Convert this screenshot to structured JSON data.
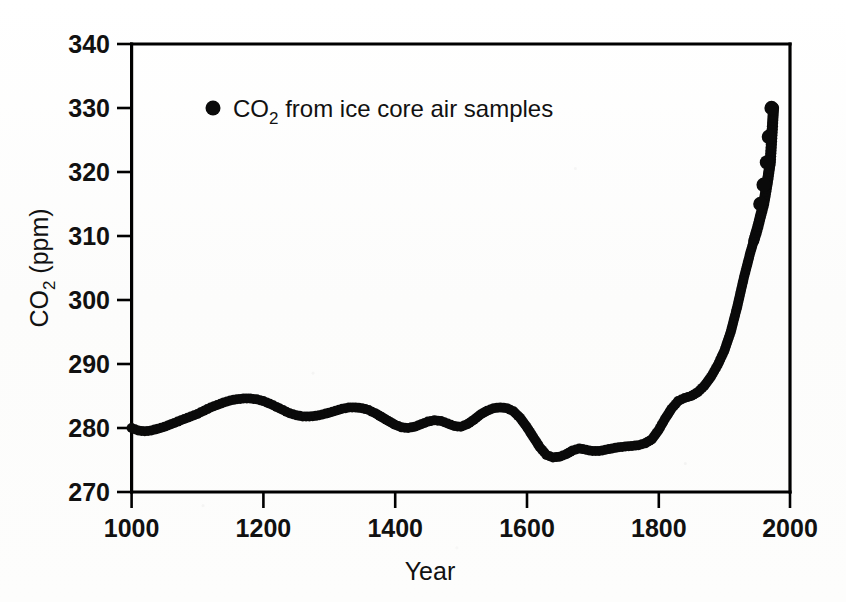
{
  "figure": {
    "background_color": "#fdfdfd",
    "ink_color": "#000000"
  },
  "legend": {
    "marker_name": "filled-circle-marker",
    "label_prefix": "CO",
    "label_sub": "2",
    "label_suffix": " from ice core air samples",
    "full_label": "CO2 from ice core air samples",
    "position": "top-left-inside"
  },
  "axes": {
    "x": {
      "title": "Year",
      "min": 1000,
      "max": 2000,
      "tick_step": 200,
      "ticks": [
        "1000",
        "1200",
        "1400",
        "1600",
        "1800",
        "2000"
      ]
    },
    "y": {
      "title_prefix": "CO",
      "title_sub": "2",
      "title_suffix": " (ppm)",
      "title_full": "CO2 (ppm)",
      "min": 270,
      "max": 340,
      "tick_step": 10,
      "ticks": [
        "270",
        "280",
        "290",
        "300",
        "310",
        "320",
        "330",
        "340"
      ]
    }
  },
  "chart_data": {
    "type": "scatter",
    "title": "",
    "subtitle": "",
    "xlabel": "Year",
    "ylabel": "CO2 (ppm)",
    "xlim": [
      1000,
      2000
    ],
    "ylim": [
      270,
      340
    ],
    "grid": false,
    "legend_position": "upper left",
    "marker": "filled circle",
    "marker_color": "#0a0a0a",
    "series": [
      {
        "name": "CO2 from ice core air samples",
        "units": "ppm",
        "x": [
          1000,
          1010,
          1020,
          1030,
          1040,
          1050,
          1060,
          1070,
          1080,
          1090,
          1100,
          1110,
          1120,
          1130,
          1140,
          1150,
          1160,
          1170,
          1180,
          1190,
          1200,
          1210,
          1220,
          1230,
          1240,
          1250,
          1260,
          1270,
          1280,
          1290,
          1300,
          1310,
          1320,
          1330,
          1340,
          1350,
          1360,
          1370,
          1380,
          1390,
          1400,
          1410,
          1420,
          1430,
          1440,
          1450,
          1460,
          1470,
          1480,
          1490,
          1500,
          1510,
          1520,
          1530,
          1540,
          1550,
          1560,
          1570,
          1580,
          1590,
          1600,
          1610,
          1620,
          1630,
          1640,
          1650,
          1660,
          1670,
          1680,
          1690,
          1700,
          1710,
          1720,
          1730,
          1740,
          1750,
          1760,
          1770,
          1780,
          1790,
          1800,
          1810,
          1820,
          1830,
          1840,
          1850,
          1860,
          1870,
          1880,
          1890,
          1900,
          1910,
          1920,
          1930,
          1940,
          1950,
          1955,
          1960,
          1965,
          1970,
          1975
        ],
        "y": [
          280.0,
          279.6,
          279.5,
          279.6,
          279.9,
          280.2,
          280.6,
          281.0,
          281.4,
          281.8,
          282.2,
          282.7,
          283.2,
          283.6,
          284.0,
          284.3,
          284.5,
          284.6,
          284.6,
          284.5,
          284.2,
          283.8,
          283.3,
          282.8,
          282.3,
          282.0,
          281.8,
          281.8,
          281.9,
          282.1,
          282.4,
          282.7,
          283.0,
          283.2,
          283.2,
          283.1,
          282.8,
          282.3,
          281.7,
          281.1,
          280.5,
          280.1,
          280.0,
          280.2,
          280.6,
          281.0,
          281.2,
          281.1,
          280.7,
          280.3,
          280.2,
          280.6,
          281.3,
          282.1,
          282.7,
          283.1,
          283.2,
          283.1,
          282.6,
          281.6,
          280.2,
          278.6,
          277.0,
          275.8,
          275.4,
          275.5,
          275.9,
          276.5,
          276.8,
          276.6,
          276.4,
          276.4,
          276.6,
          276.8,
          277.0,
          277.1,
          277.2,
          277.3,
          277.6,
          278.2,
          279.6,
          281.4,
          283.0,
          284.2,
          284.7,
          285.0,
          285.6,
          286.6,
          288.0,
          289.8,
          292.0,
          295.0,
          299.0,
          303.5,
          307.5,
          311.0,
          313.0,
          315.0,
          318.0,
          321.5,
          330.0
        ],
        "note_detached_points": [
          {
            "x": 1955,
            "y": 315.0
          },
          {
            "x": 1960,
            "y": 318.0
          },
          {
            "x": 1965,
            "y": 321.5
          },
          {
            "x": 1968,
            "y": 325.5
          },
          {
            "x": 1972,
            "y": 330.0
          }
        ]
      }
    ],
    "annotations": [
      "Pre-industrial CO2 fluctuates around 275-285 ppm from 1000 to 1800 CE",
      "Sharp industrial-era rise begins near 1800, reaching about 330 ppm by 1970"
    ]
  }
}
